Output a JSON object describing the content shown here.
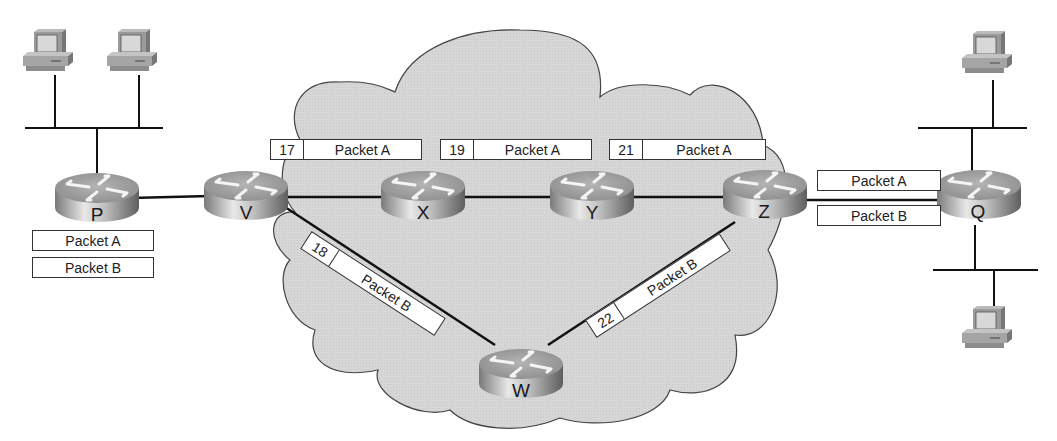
{
  "diagram": {
    "type": "network-topology",
    "cloud": {
      "label": "",
      "fill": "#d9d9d9",
      "stroke": "#444444"
    },
    "routers": [
      {
        "id": "P",
        "label": "P"
      },
      {
        "id": "V",
        "label": "V"
      },
      {
        "id": "X",
        "label": "X"
      },
      {
        "id": "Y",
        "label": "Y"
      },
      {
        "id": "Z",
        "label": "Z"
      },
      {
        "id": "W",
        "label": "W"
      },
      {
        "id": "Q",
        "label": "Q"
      }
    ],
    "links": [
      [
        "P",
        "V"
      ],
      [
        "V",
        "X"
      ],
      [
        "X",
        "Y"
      ],
      [
        "Y",
        "Z"
      ],
      [
        "V",
        "W"
      ],
      [
        "W",
        "Z"
      ],
      [
        "Z",
        "Q"
      ]
    ],
    "hosts": {
      "left_lan": [
        "PC 1",
        "PC 2"
      ],
      "right_top_lan": [
        "PC 3"
      ],
      "right_bottom_lan": [
        "PC 4"
      ]
    },
    "source_queue": [
      {
        "label": "Packet A"
      },
      {
        "label": "Packet B"
      }
    ],
    "path_labels": {
      "v_x": {
        "seq": "17",
        "label": "Packet A"
      },
      "x_y": {
        "seq": "19",
        "label": "Packet A"
      },
      "y_z": {
        "seq": "21",
        "label": "Packet A"
      },
      "v_w": {
        "seq": "18",
        "label": "Packet B"
      },
      "w_z": {
        "seq": "22",
        "label": "Packet B"
      }
    },
    "z_q_link": [
      {
        "label": "Packet A"
      },
      {
        "label": "Packet B"
      }
    ]
  }
}
